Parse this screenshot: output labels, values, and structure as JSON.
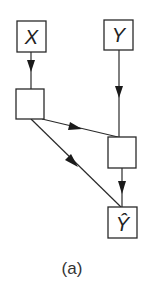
{
  "diagram": {
    "type": "neural-network-graph",
    "caption": "(a)",
    "nodes": [
      {
        "id": "x",
        "label": "X",
        "kind": "input"
      },
      {
        "id": "y",
        "label": "Y",
        "kind": "input"
      },
      {
        "id": "h1",
        "label": "",
        "kind": "hidden"
      },
      {
        "id": "h2",
        "label": "",
        "kind": "hidden"
      },
      {
        "id": "yhat",
        "label": "Ŷ",
        "kind": "output"
      }
    ],
    "edges": [
      {
        "from": "x",
        "to": "h1"
      },
      {
        "from": "y",
        "to": "h2"
      },
      {
        "from": "h1",
        "to": "h2"
      },
      {
        "from": "h1",
        "to": "yhat"
      },
      {
        "from": "h2",
        "to": "yhat"
      }
    ],
    "colors": {
      "stroke": "#2a2a2a",
      "background": "#ffffff"
    }
  }
}
